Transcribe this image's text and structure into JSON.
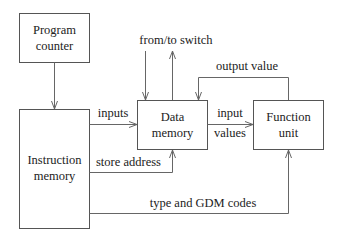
{
  "diagram": {
    "blocks": {
      "program_counter": {
        "line1": "Program",
        "line2": "counter"
      },
      "instruction_memory": {
        "line1": "Instruction",
        "line2": "memory"
      },
      "data_memory": {
        "line1": "Data",
        "line2": "memory"
      },
      "function_unit": {
        "line1": "Function",
        "line2": "unit"
      }
    },
    "edges": {
      "from_to_switch": "from/to switch",
      "output_value": "output value",
      "inputs": "inputs",
      "input_values_line1": "input",
      "input_values_line2": "values",
      "store_address": "store address",
      "type_gdm_codes": "type and GDM codes"
    },
    "colors": {
      "stroke": "#666666",
      "box_stroke": "#555555",
      "text": "#222222",
      "background": "#ffffff"
    }
  }
}
